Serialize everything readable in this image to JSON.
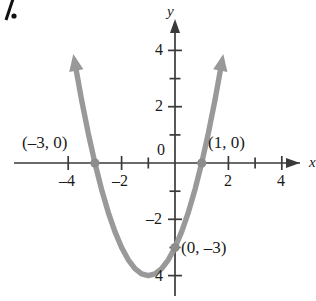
{
  "figure": {
    "problem_number": "7.",
    "axis_labels": {
      "x": "x",
      "y": "y"
    },
    "x_tick_labels": [
      "–4",
      "–2",
      "2",
      "4"
    ],
    "y_tick_labels": [
      "4",
      "2",
      "0",
      "–2",
      "4"
    ],
    "point_labels": [
      "(–3, 0)",
      "(1, 0)",
      "(0, –3)"
    ],
    "colors": {
      "curve": "#999999",
      "axis": "#3a3a3a",
      "text": "#1a1a1a",
      "background": "#ffffff"
    }
  },
  "chart_data": {
    "type": "line",
    "title": "",
    "subtitle": "",
    "xlabel": "x",
    "ylabel": "y",
    "xlim": [
      -4.6,
      4.9
    ],
    "ylim": [
      -4.9,
      5.1
    ],
    "xticks": [
      -4,
      -2,
      0,
      2,
      4
    ],
    "yticks": [
      -4,
      -2,
      0,
      2,
      4
    ],
    "xtick_labels": [
      "–4",
      "–2",
      "",
      "2",
      "4"
    ],
    "ytick_labels": [
      "–4",
      "–2",
      "0",
      "2",
      "4"
    ],
    "minor_tick_step": 1,
    "grid": false,
    "legend": null,
    "series": [
      {
        "name": "y = x² + 2x – 3",
        "type": "parabola",
        "color": "#999999",
        "linewidth": 5,
        "arrow_start": true,
        "arrow_end": true,
        "vertex": [
          -1,
          -4
        ],
        "a": 1,
        "x_range": [
          -3.75,
          1.75
        ],
        "points_x": [
          -3.75,
          -3.5,
          -3.25,
          -3,
          -2.75,
          -2.5,
          -2.25,
          -2,
          -1.75,
          -1.5,
          -1.25,
          -1,
          -0.75,
          -0.5,
          -0.25,
          0,
          0.25,
          0.5,
          0.75,
          1,
          1.25,
          1.5,
          1.75
        ],
        "points_y": [
          3.5625,
          2.25,
          1.0625,
          0,
          -0.9375,
          -1.75,
          -2.4375,
          -3,
          -3.4375,
          -3.75,
          -3.9375,
          -4,
          -3.9375,
          -3.75,
          -3.4375,
          -3,
          -2.4375,
          -1.75,
          -0.9375,
          0,
          1.0625,
          2.25,
          3.5625
        ]
      }
    ],
    "annotations": [
      {
        "label": "(–3, 0)",
        "x": -3,
        "y": 0,
        "marker": true,
        "label_dx": -56,
        "label_dy": -26
      },
      {
        "label": "(1, 0)",
        "x": 1,
        "y": 0,
        "marker": true,
        "label_dx": 10,
        "label_dy": -26
      },
      {
        "label": "(0, –3)",
        "x": 0,
        "y": -3,
        "marker": true,
        "label_dx": 10,
        "label_dy": 2
      }
    ]
  }
}
